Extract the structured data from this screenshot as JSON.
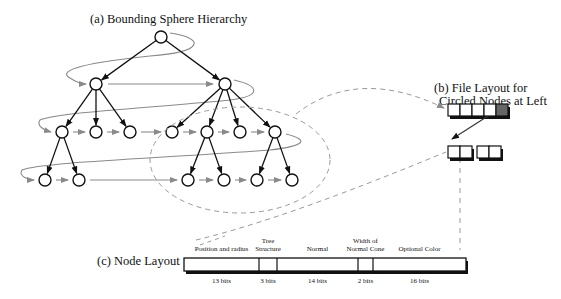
{
  "figure": {
    "panel_a": {
      "title": "(a) Bounding Sphere Hierarchy",
      "nodes": [
        {
          "id": "root",
          "x": 161,
          "y": 37
        },
        {
          "id": "L1a",
          "x": 96,
          "y": 84
        },
        {
          "id": "L1b",
          "x": 225,
          "y": 84
        },
        {
          "id": "L2a",
          "x": 62,
          "y": 132
        },
        {
          "id": "L2b",
          "x": 96,
          "y": 132
        },
        {
          "id": "L2c",
          "x": 130,
          "y": 132
        },
        {
          "id": "L2d",
          "x": 172,
          "y": 132
        },
        {
          "id": "L2e",
          "x": 207,
          "y": 132
        },
        {
          "id": "L2f",
          "x": 240,
          "y": 132
        },
        {
          "id": "L2g",
          "x": 275,
          "y": 132
        },
        {
          "id": "L3a",
          "x": 45,
          "y": 180
        },
        {
          "id": "L3b",
          "x": 79,
          "y": 180
        },
        {
          "id": "L3c",
          "x": 188,
          "y": 180
        },
        {
          "id": "L3d",
          "x": 224,
          "y": 180
        },
        {
          "id": "L3e",
          "x": 257,
          "y": 180
        },
        {
          "id": "L3f",
          "x": 292,
          "y": 180
        }
      ],
      "tree_edges": [
        [
          "root",
          "L1a"
        ],
        [
          "root",
          "L1b"
        ],
        [
          "L1a",
          "L2a"
        ],
        [
          "L1a",
          "L2b"
        ],
        [
          "L1a",
          "L2c"
        ],
        [
          "L1b",
          "L2d"
        ],
        [
          "L1b",
          "L2e"
        ],
        [
          "L1b",
          "L2f"
        ],
        [
          "L1b",
          "L2g"
        ],
        [
          "L2a",
          "L3a"
        ],
        [
          "L2a",
          "L3b"
        ],
        [
          "L2e",
          "L3c"
        ],
        [
          "L2e",
          "L3d"
        ],
        [
          "L2g",
          "L3e"
        ],
        [
          "L2g",
          "L3f"
        ]
      ],
      "traversal_order": [
        "root",
        "L1a",
        "L1b",
        "L2a",
        "L2b",
        "L2c",
        "L2d",
        "L2e",
        "L2f",
        "L2g",
        "L3a",
        "L3b",
        "L3c",
        "L3d",
        "L3e",
        "L3f"
      ],
      "circled_region": {
        "cx": 240,
        "cy": 160,
        "rx": 90,
        "ry": 53
      }
    },
    "panel_b": {
      "title_line1": "(b) File Layout for",
      "title_line2": "Circled Nodes at Left",
      "row1_boxes": 5,
      "row1_highlighted_index": 4,
      "row2_groups": [
        2,
        2
      ]
    },
    "panel_c": {
      "title": "(c) Node Layout",
      "fields": [
        {
          "label": "Position and radius",
          "bits": "13 bits"
        },
        {
          "label": "Tree Structure",
          "bits": "3 bits"
        },
        {
          "label": "Normal",
          "bits": "14 bits"
        },
        {
          "label": "Width of Normal Cone",
          "bits": "2 bits"
        },
        {
          "label": "Optional Color",
          "bits": "16 bits"
        }
      ]
    },
    "colors": {
      "node_stroke": "#111111",
      "tree_edge": "#111111",
      "traversal_arrow": "#8a8a8a",
      "dashed_line": "#9a9a9a",
      "highlight_box": "#666666"
    }
  }
}
